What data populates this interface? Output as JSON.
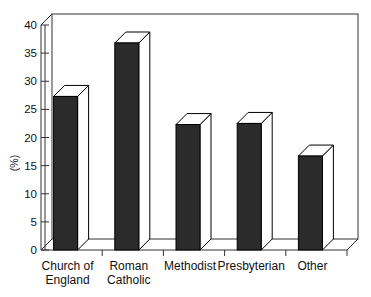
{
  "chart_data": {
    "type": "bar",
    "title": "",
    "xlabel": "",
    "ylabel": "(%)",
    "categories": [
      "Church of\nEngland",
      "Roman\nCatholic",
      "Methodist",
      "Presbyterian",
      "Other"
    ],
    "category_lines": [
      [
        "Church of",
        "England"
      ],
      [
        "Roman",
        "Catholic"
      ],
      [
        "Methodist"
      ],
      [
        "Presbyterian"
      ],
      [
        "Other"
      ]
    ],
    "values": [
      27.3,
      36.8,
      22.3,
      22.5,
      16.7
    ],
    "ylim": [
      0,
      40
    ],
    "yticks": [
      0,
      5,
      10,
      15,
      20,
      25,
      30,
      35,
      40
    ],
    "ytick_labels": [
      "0",
      "5",
      "10",
      "15",
      "20",
      "25",
      "30",
      "35",
      "40"
    ],
    "grid": false,
    "legend": false,
    "style": "3d-bar",
    "bar_face_color": "#2b2b2b",
    "bar_top_color": "#ffffff",
    "bar_side_color": "#ffffff",
    "bar_outline_color": "#000000",
    "axis_color": "#333333",
    "background_color": "#ffffff"
  },
  "axes": {
    "y_title": "(%)"
  }
}
